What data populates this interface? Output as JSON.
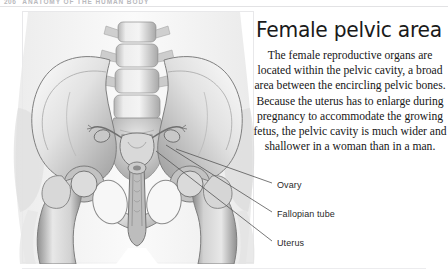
{
  "page": {
    "running_head": {
      "page_number": "206",
      "text": "ANATOMY OF THE HUMAN BODY"
    },
    "background_color": "#ffffff"
  },
  "article": {
    "title": "Female pelvic area",
    "body": "The female reproductive organs are located within the pelvic cavity, a broad area between the encircling pelvic bones. Because the uterus has to enlarge during pregnancy to accommodate the growing fetus, the pelvic cavity is much wider and shallower in a woman than in a man."
  },
  "illustration": {
    "caption_name": "female-pelvis-anatomical-drawing",
    "style": "grayscale pencil rendering",
    "subject": "Anterior view of the female bony pelvis with lumbar spine, sacrum, ilia, femurs and pelvic reproductive organs"
  },
  "callouts": [
    {
      "id": "ovary",
      "label": "Ovary",
      "leader_from_x": 175,
      "leader_from_y": 148,
      "leader_to_x": 272,
      "leader_to_y": 184
    },
    {
      "id": "fallopian",
      "label": "Fallopian tube",
      "leader_from_x": 166,
      "leader_from_y": 144,
      "leader_to_x": 272,
      "leader_to_y": 213
    },
    {
      "id": "uterus",
      "label": "Uterus",
      "leader_from_x": 156,
      "leader_from_y": 150,
      "leader_to_x": 272,
      "leader_to_y": 242
    }
  ],
  "colors": {
    "text": "#161616",
    "title": "#1a1a1a",
    "running_head": "#b9b9bd",
    "rule": "#e8e8ea",
    "leader_line": "#555555"
  }
}
